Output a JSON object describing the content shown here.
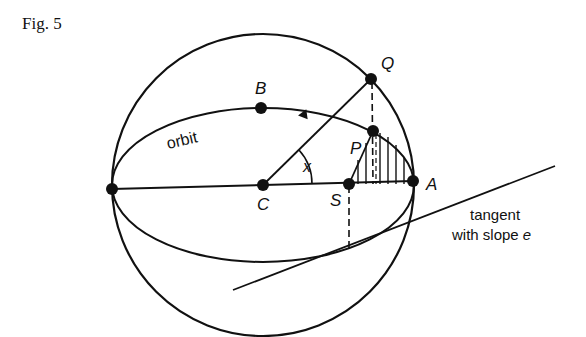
{
  "caption": "Fig. 5",
  "labels": {
    "Q": "Q",
    "B": "B",
    "P": "P",
    "x": "x",
    "A": "A",
    "C": "C",
    "S": "S",
    "orbit": "orbit",
    "tangent_line1": "tangent",
    "tangent_line2": "with slope",
    "tangent_e": "e"
  },
  "geometry": {
    "circle": {
      "cx": 263,
      "cy": 185,
      "r": 151
    },
    "ellipse": {
      "cx": 263,
      "cy": 185,
      "rx": 151,
      "ry": 77
    },
    "points": {
      "C": [
        263,
        185
      ],
      "S": [
        349,
        184
      ],
      "A": [
        413,
        181
      ],
      "left_vertex": [
        112,
        189
      ],
      "B": [
        261,
        108
      ],
      "Q": [
        371,
        79
      ],
      "P": [
        373,
        131
      ]
    },
    "tangent_line": [
      [
        233,
        290
      ],
      [
        555,
        166
      ]
    ],
    "colors": {
      "ink": "#111111",
      "background": "#ffffff"
    }
  }
}
